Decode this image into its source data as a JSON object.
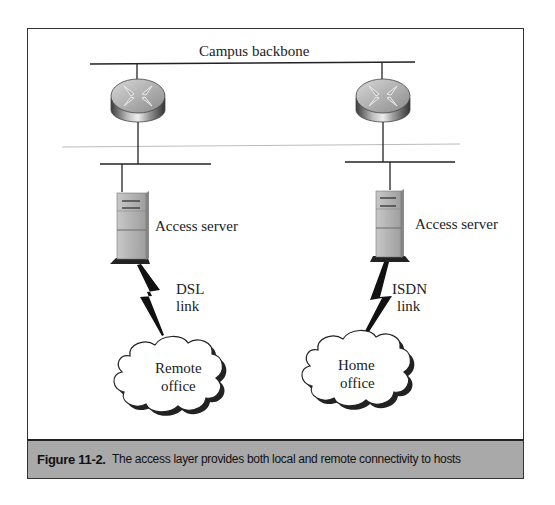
{
  "figure": {
    "backbone_label": "Campus backbone",
    "left_branch": {
      "server_label": "Access server",
      "link_label_line1": "DSL",
      "link_label_line2": "link",
      "cloud_line1": "Remote",
      "cloud_line2": "office"
    },
    "right_branch": {
      "server_label": "Access server",
      "link_label_line1": "ISDN",
      "link_label_line2": "link",
      "cloud_line1": "Home",
      "cloud_line2": "office"
    },
    "icons": [
      "router-icon",
      "router-icon",
      "server-icon",
      "server-icon",
      "lightning-link-icon",
      "lightning-link-icon",
      "cloud-icon",
      "cloud-icon"
    ]
  },
  "caption": {
    "number": "Figure 11-2.",
    "text": "The access layer provides both local and remote connectivity to hosts"
  },
  "colors": {
    "caption_bar": "#a9a9a9",
    "line": "#333333",
    "divider": "#bbbbbb"
  }
}
